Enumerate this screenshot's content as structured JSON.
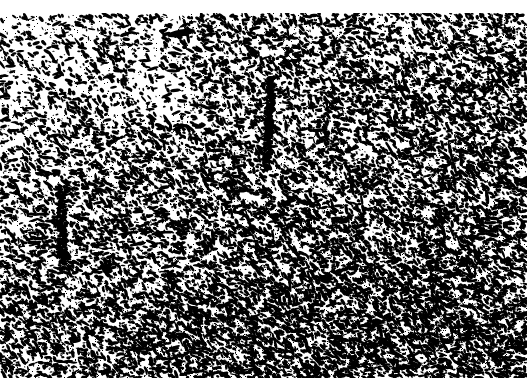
{
  "figure": {
    "kind": "histology-micrograph",
    "modality": "light-microscopy",
    "rendering": "binarized-halftone",
    "width_px": 527,
    "height_px": 390,
    "background_color": "#ffffff",
    "foreground_color": "#000000",
    "caption": "",
    "scale_bar_label": "",
    "title": ""
  },
  "canvas": {
    "margins": {
      "top_band_height_px": 13,
      "bottom_band_height_px": 12,
      "left_band_width_px": 0,
      "right_band_width_px": 0
    },
    "field": {
      "top_px": 13,
      "bottom_px": 378,
      "left_px": 0,
      "right_px": 527
    }
  },
  "texture": {
    "seed": 20240517,
    "particle_count": 26000,
    "particle_min_size_px": 1,
    "particle_max_size_px": 5,
    "elongation_max": 3.2,
    "orientation_bias_deg": 28,
    "base_density": 0.52,
    "density_gradient": {
      "direction": "top-left-to-bottom-right",
      "min": 0.3,
      "max": 1.0
    },
    "top_edge_slope": {
      "left_y_px": 16,
      "right_y_px": 10
    }
  },
  "features": [
    {
      "name": "dark-blob-upper-left",
      "type": "blob",
      "x_px": 181,
      "y_px": 33,
      "width_px": 28,
      "height_px": 7,
      "angle_deg": -10
    },
    {
      "name": "vessel-streak-left",
      "type": "vertical-streak",
      "x_px": 62,
      "y_px": 228,
      "width_px": 9,
      "height_px": 84,
      "angle_deg": 2,
      "density": 0.95
    },
    {
      "name": "vessel-streak-center",
      "type": "vertical-streak",
      "x_px": 269,
      "y_px": 120,
      "width_px": 7,
      "height_px": 86,
      "angle_deg": -3,
      "density": 0.85
    },
    {
      "name": "clear-zone-upper-center",
      "type": "clear-zone",
      "x_px": 150,
      "y_px": 95,
      "width_px": 120,
      "height_px": 70,
      "clearing": 0.45
    },
    {
      "name": "clear-zone-upper-left",
      "type": "clear-zone",
      "x_px": 55,
      "y_px": 60,
      "width_px": 90,
      "height_px": 55,
      "clearing": 0.4
    },
    {
      "name": "dense-zone-lower-right",
      "type": "dense-zone",
      "x_px": 430,
      "y_px": 320,
      "width_px": 200,
      "height_px": 150,
      "boost": 0.55
    },
    {
      "name": "dense-zone-lower-center",
      "type": "dense-zone",
      "x_px": 250,
      "y_px": 350,
      "width_px": 220,
      "height_px": 90,
      "boost": 0.35
    },
    {
      "name": "smudge-top-center",
      "type": "faint-smudge",
      "x_px": 264,
      "y_px": 4,
      "width_px": 16,
      "height_px": 4,
      "opacity": 0.18
    }
  ],
  "labels": {
    "top_margin": "",
    "bottom_margin": "",
    "overlay_text": []
  }
}
